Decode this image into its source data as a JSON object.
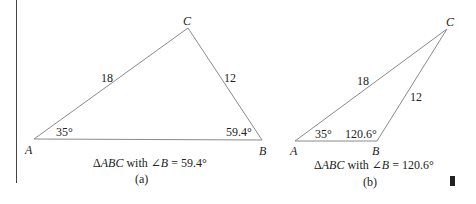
{
  "figure_a": {
    "vertices": {
      "A": "A",
      "B": "B",
      "C": "C"
    },
    "side_AC": "18",
    "side_BC": "12",
    "angle_A": "35°",
    "angle_B": "59.4°",
    "caption_prefix": "Δ",
    "caption_triangle": "ABC",
    "caption_with": " with ∠",
    "caption_angle_var": "B",
    "caption_value": " = 59.4°",
    "sublabel": "(a)"
  },
  "figure_b": {
    "vertices": {
      "A": "A",
      "B": "B",
      "C": "C"
    },
    "side_AC": "18",
    "side_BC": "12",
    "angle_A": "35°",
    "angle_B": "120.6°",
    "caption_prefix": "Δ",
    "caption_triangle": "ABC",
    "caption_with": " with ∠",
    "caption_angle_var": "B",
    "caption_value": " = 120.6°",
    "sublabel": "(b)"
  },
  "colors": {
    "line": "#8a8a8a",
    "text": "#222222",
    "marker": "#222222"
  }
}
